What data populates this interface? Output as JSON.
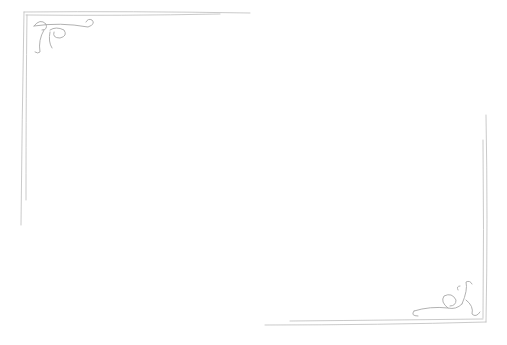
{
  "image": {
    "description": "Blank page with hand-drawn pencil decorative corner frame",
    "background": "#ffffff",
    "stroke_color": "#b8b8b8",
    "ornaments": [
      {
        "name": "top-left-flourish",
        "corner": "top-left"
      },
      {
        "name": "bottom-right-flourish",
        "corner": "bottom-right"
      }
    ]
  }
}
